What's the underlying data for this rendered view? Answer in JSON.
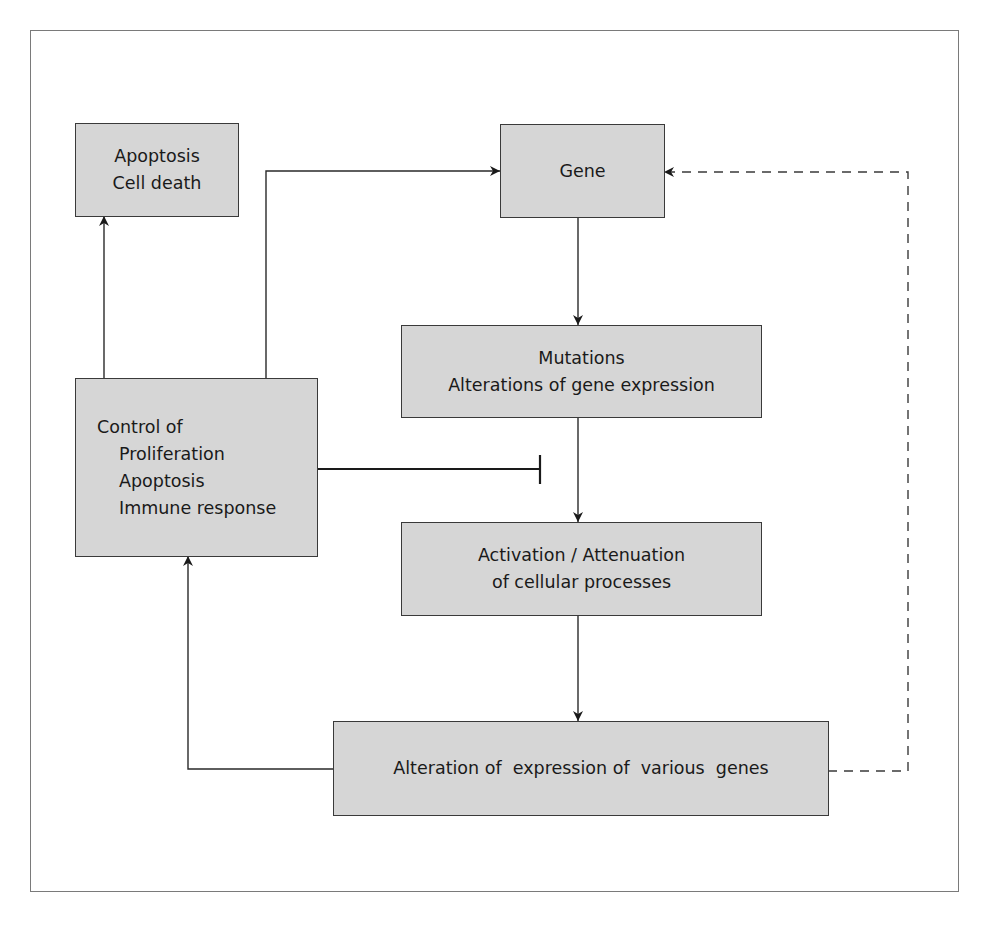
{
  "diagram": {
    "type": "flowchart",
    "nodes": {
      "apoptosis": {
        "lines": [
          "Apoptosis",
          "Cell death"
        ]
      },
      "gene": {
        "lines": [
          "Gene"
        ]
      },
      "mutations": {
        "lines": [
          "Mutations",
          "Alterations of gene expression"
        ]
      },
      "control": {
        "title": "Control of",
        "items": [
          "Proliferation",
          "Apoptosis",
          "Immune response"
        ]
      },
      "activation": {
        "lines": [
          "Activation / Attenuation",
          "of cellular processes"
        ]
      },
      "alteration": {
        "lines": [
          "Alteration of  expression of  various  genes"
        ]
      }
    },
    "edges": [
      {
        "from": "gene",
        "to": "mutations",
        "style": "arrow"
      },
      {
        "from": "mutations",
        "to": "activation",
        "style": "arrow"
      },
      {
        "from": "activation",
        "to": "alteration",
        "style": "arrow"
      },
      {
        "from": "alteration",
        "to": "control",
        "style": "arrow"
      },
      {
        "from": "alteration",
        "to": "gene",
        "style": "dashed-arrow"
      },
      {
        "from": "control",
        "to": "apoptosis",
        "style": "arrow"
      },
      {
        "from": "control",
        "to": "gene",
        "style": "arrow"
      },
      {
        "from": "control",
        "to": "mutations-activation-edge",
        "style": "inhibition"
      }
    ],
    "colors": {
      "box_fill": "#d6d6d6",
      "box_border": "#3a3a3a",
      "line": "#2a2a2a",
      "frame": "#7a7a7a"
    }
  }
}
